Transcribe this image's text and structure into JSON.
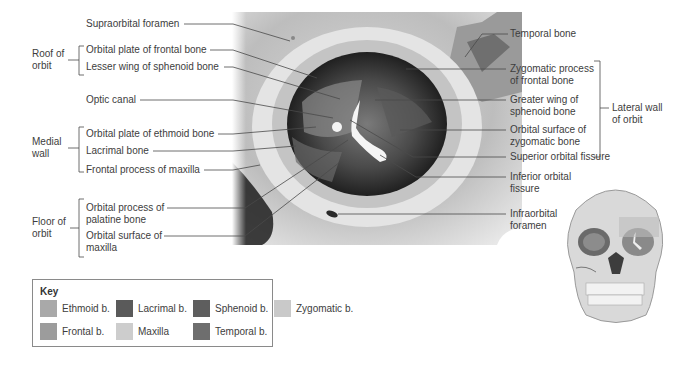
{
  "left_labels": {
    "supraorbital_foramen": "Supraorbital foramen",
    "orbital_plate_frontal": "Orbital plate of frontal bone",
    "lesser_wing_sphenoid": "Lesser wing of sphenoid bone",
    "optic_canal": "Optic canal",
    "orbital_plate_ethmoid": "Orbital plate of ethmoid bone",
    "lacrimal_bone": "Lacrimal bone",
    "frontal_process_maxilla": "Frontal process of maxilla",
    "orbital_process_palatine_1": "Orbital process of",
    "orbital_process_palatine_2": "palatine bone",
    "orbital_surface_maxilla_1": "Orbital surface of",
    "orbital_surface_maxilla_2": "maxilla"
  },
  "groups": {
    "roof_1": "Roof of",
    "roof_2": "orbit",
    "medial_1": "Medial",
    "medial_2": "wall",
    "floor_1": "Floor of",
    "floor_2": "orbit",
    "lateral_1": "Lateral wall",
    "lateral_2": "of orbit"
  },
  "right_labels": {
    "temporal_bone": "Temporal bone",
    "zygomatic_process_1": "Zygomatic process",
    "zygomatic_process_2": "of frontal bone",
    "greater_wing_1": "Greater wing of",
    "greater_wing_2": "sphenoid bone",
    "orbital_surface_zyg_1": "Orbital surface of",
    "orbital_surface_zyg_2": "zygomatic bone",
    "superior_orbital_fissure": "Superior orbital fissure",
    "inferior_orbital_fissure_1": "Inferior orbital",
    "inferior_orbital_fissure_2": "fissure",
    "infraorbital_foramen_1": "Infraorbital",
    "infraorbital_foramen_2": "foramen"
  },
  "key": {
    "title": "Key",
    "items": [
      {
        "label": "Ethmoid b.",
        "color": "#a9a9a9"
      },
      {
        "label": "Lacrimal b.",
        "color": "#5a5a5a"
      },
      {
        "label": "Sphenoid b.",
        "color": "#5e5e5e"
      },
      {
        "label": "Zygomatic b.",
        "color": "#c9c9c9"
      },
      {
        "label": "Frontal b.",
        "color": "#9c9c9c"
      },
      {
        "label": "Maxilla",
        "color": "#cdcdcd"
      },
      {
        "label": "Temporal b.",
        "color": "#6e6e6e"
      }
    ]
  }
}
